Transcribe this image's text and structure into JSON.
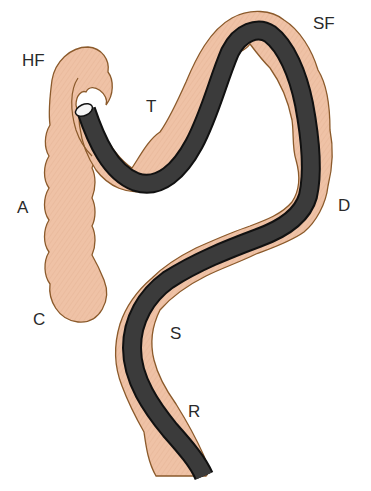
{
  "diagram": {
    "colors": {
      "background": "#ffffff",
      "colon_fill": "#efc2a6",
      "colon_outline": "#8b5a2b",
      "scope_fill": "#3b3b3b",
      "scope_edge": "#111111",
      "scope_tip": "#f5f5f5",
      "label_text": "#2a2a2a"
    },
    "labels": [
      {
        "id": "HF",
        "text": "HF",
        "x": 22,
        "y": 52
      },
      {
        "id": "T",
        "text": "T",
        "x": 146,
        "y": 98
      },
      {
        "id": "SF",
        "text": "SF",
        "x": 313,
        "y": 15
      },
      {
        "id": "A",
        "text": "A",
        "x": 17,
        "y": 199
      },
      {
        "id": "D",
        "text": "D",
        "x": 338,
        "y": 197
      },
      {
        "id": "C",
        "text": "C",
        "x": 33,
        "y": 311
      },
      {
        "id": "S",
        "text": "S",
        "x": 170,
        "y": 325
      },
      {
        "id": "R",
        "text": "R",
        "x": 188,
        "y": 403
      }
    ]
  }
}
